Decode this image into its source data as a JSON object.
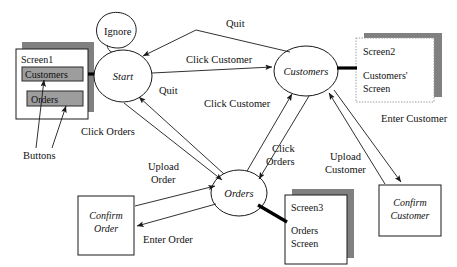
{
  "diagram": {
    "states": [
      {
        "id": "ignore",
        "label": "Ignore",
        "shape": "self-loop"
      },
      {
        "id": "start",
        "label": "Start",
        "shape": "circle"
      },
      {
        "id": "customers",
        "label": "Customers",
        "shape": "circle"
      },
      {
        "id": "orders",
        "label": "Orders",
        "shape": "circle"
      }
    ],
    "screens": [
      {
        "id": "screen1",
        "name": "Screen1",
        "caption": "",
        "buttons": [
          "Customers",
          "Orders"
        ]
      },
      {
        "id": "screen2",
        "name": "Screen2",
        "caption": "Customers' Screen",
        "buttons": []
      },
      {
        "id": "screen3",
        "name": "Screen3",
        "caption": "Orders Screen",
        "buttons": []
      }
    ],
    "processes": [
      {
        "id": "confirm-order",
        "line1": "Confirm",
        "line2": "Order"
      },
      {
        "id": "confirm-customer",
        "line1": "Confirm",
        "line2": "Customer"
      }
    ],
    "annotations": [
      {
        "id": "buttons-callout",
        "label": "Buttons"
      }
    ],
    "transitions": [
      {
        "id": "t-quit-cust-start",
        "label": "Quit",
        "from": "customers",
        "to": "start"
      },
      {
        "id": "t-click-customer-start",
        "label": "Click Customer",
        "from": "start",
        "to": "customers"
      },
      {
        "id": "t-quit-orders-start",
        "label": "Quit",
        "from": "orders",
        "to": "start"
      },
      {
        "id": "t-click-orders-start",
        "label": "Click Orders",
        "from": "start",
        "to": "orders"
      },
      {
        "id": "t-click-customer-orders",
        "label": "Click Customer",
        "from": "orders",
        "to": "customers"
      },
      {
        "id": "t-click-orders-cust",
        "label": "Click\nOrders",
        "from": "customers",
        "to": "orders"
      },
      {
        "id": "t-upload-order",
        "label": "Upload\nOrder",
        "from": "confirm-order",
        "to": "orders"
      },
      {
        "id": "t-enter-order",
        "label": "Enter Order",
        "from": "orders",
        "to": "confirm-order"
      },
      {
        "id": "t-upload-customer",
        "label": "Upload\nCustomer",
        "from": "confirm-customer",
        "to": "customers"
      },
      {
        "id": "t-enter-customer",
        "label": "Enter Customer",
        "from": "customers",
        "to": "confirm-customer"
      }
    ],
    "labels": {
      "quit_top": "Quit",
      "quit_mid": "Quit",
      "click_customer_top": "Click Customer",
      "click_customer_mid": "Click Customer",
      "click_orders_left": "Click Orders",
      "click_orders_right_1": "Click",
      "click_orders_right_2": "Orders",
      "upload_order_1": "Upload",
      "upload_order_2": "Order",
      "enter_order": "Enter Order",
      "upload_customer_1": "Upload",
      "upload_customer_2": "Customer",
      "enter_customer": "Enter Customer",
      "buttons": "Buttons",
      "ignore": "Ignore",
      "start": "Start",
      "customers": "Customers",
      "orders": "Orders",
      "screen1": "Screen1",
      "screen1_btn1": "Customers",
      "screen1_btn2": "Orders",
      "screen2": "Screen2",
      "screen2_cap1": "Customers'",
      "screen2_cap2": "Screen",
      "screen3": "Screen3",
      "screen3_cap1": "Orders",
      "screen3_cap2": "Screen",
      "confirm_order_1": "Confirm",
      "confirm_order_2": "Order",
      "confirm_customer_1": "Confirm",
      "confirm_customer_2": "Customer"
    },
    "colors": {
      "line": "#1a1a1a",
      "shadow": "#808080",
      "button_fill": "#9d9d9d",
      "background": "#ffffff"
    }
  }
}
